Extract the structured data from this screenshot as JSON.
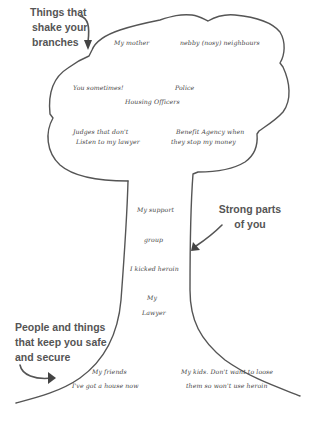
{
  "callouts": {
    "branches": [
      "Things that",
      "shake your",
      "branches"
    ],
    "trunk": [
      "Strong parts",
      "of you"
    ],
    "roots": [
      "People and things",
      "that keep you safe",
      "and secure"
    ]
  },
  "canopy_items": {
    "my_mother": "My mother",
    "nosy_neighbours": "nebby (nosy) neighbours",
    "you_sometimes": "You sometimes!",
    "police": "Police",
    "housing_officers": "Housing Officers",
    "judges_1": "Judges that don't",
    "judges_2": "Listen to my lawyer",
    "benefit_1": "Benefit Agency when",
    "benefit_2": "they stop my money"
  },
  "trunk_items": {
    "support_1": "My support",
    "support_2": "group",
    "kicked": "I kicked heroin",
    "lawyer_1": "My",
    "lawyer_2": "Lawyer"
  },
  "root_items": {
    "friends": "My friends",
    "house": "I've got a house now",
    "kids_1": "My kids. Don't want to loose",
    "kids_2": "them so won't use heroin"
  },
  "colors": {
    "outline": "#555555",
    "text": "#444444",
    "callout": "#555555"
  }
}
